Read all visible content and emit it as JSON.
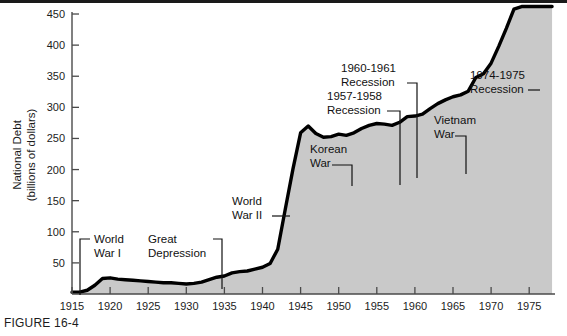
{
  "figure": {
    "caption": "FIGURE 16-4"
  },
  "chart_data": {
    "type": "area",
    "title": "",
    "xlabel": "",
    "ylabel": "National Debt (billions of dollars)",
    "ylabel_line1": "National Debt",
    "ylabel_line2": "(billions of dollars)",
    "xlim": [
      1915,
      1978
    ],
    "ylim": [
      0,
      470
    ],
    "grid": false,
    "legend": "none",
    "area_fill_color": "#c9c9c9",
    "line_color": "#000000",
    "background_color": "#ffffff",
    "y_ticks": [
      50,
      100,
      150,
      200,
      250,
      300,
      350,
      400,
      450
    ],
    "y_tick_labels": [
      "50",
      "100",
      "150",
      "200",
      "250",
      "300",
      "350",
      "400",
      "450"
    ],
    "x_ticks": [
      1915,
      1920,
      1925,
      1930,
      1935,
      1940,
      1945,
      1950,
      1955,
      1960,
      1965,
      1970,
      1975
    ],
    "x_tick_labels": [
      "1915",
      "1920",
      "1925",
      "1930",
      "1935",
      "1940",
      "1945",
      "1950",
      "1955",
      "1960",
      "1965",
      "1970",
      "1975"
    ],
    "x": [
      1915,
      1916,
      1917,
      1918,
      1919,
      1920,
      1921,
      1922,
      1923,
      1924,
      1925,
      1926,
      1927,
      1928,
      1929,
      1930,
      1931,
      1932,
      1933,
      1934,
      1935,
      1936,
      1937,
      1938,
      1939,
      1940,
      1941,
      1942,
      1943,
      1944,
      1945,
      1946,
      1947,
      1948,
      1949,
      1950,
      1951,
      1952,
      1953,
      1954,
      1955,
      1956,
      1957,
      1958,
      1959,
      1960,
      1961,
      1962,
      1963,
      1964,
      1965,
      1966,
      1967,
      1968,
      1969,
      1970,
      1971,
      1972,
      1973,
      1974,
      1975,
      1976,
      1977,
      1978
    ],
    "values": [
      3,
      3,
      6,
      14,
      25,
      26,
      24,
      23,
      22,
      21,
      20,
      19,
      18,
      18,
      17,
      16,
      17,
      19,
      23,
      27,
      29,
      34,
      36,
      37,
      40,
      43,
      49,
      72,
      137,
      201,
      259,
      270,
      258,
      252,
      253,
      257,
      255,
      259,
      266,
      271,
      274,
      273,
      271,
      276,
      285,
      286,
      289,
      298,
      306,
      312,
      317,
      320,
      326,
      348,
      354,
      371,
      398,
      427,
      458,
      475,
      533,
      620,
      699,
      772
    ],
    "display_values_scaled_note": "curve plotted against left axis 0-450+ billions",
    "annotations": [
      {
        "label_line1": "World",
        "label_line2": "War I",
        "year": 1917,
        "name": "world-war-i"
      },
      {
        "label_line1": "Great",
        "label_line2": "Depression",
        "year": 1934,
        "name": "great-depression"
      },
      {
        "label_line1": "World",
        "label_line2": "War II",
        "year": 1943,
        "name": "world-war-ii"
      },
      {
        "label_line1": "Korean",
        "label_line2": "War",
        "year": 1951,
        "name": "korean-war"
      },
      {
        "label_line1": "1957-1958",
        "label_line2": "Recession",
        "year": 1958,
        "name": "recession-1957-1958"
      },
      {
        "label_line1": "1960-1961",
        "label_line2": "Recession",
        "year": 1961,
        "name": "recession-1960-1961"
      },
      {
        "label_line1": "Vietnam",
        "label_line2": "War",
        "year": 1967,
        "name": "vietnam-war"
      },
      {
        "label_line1": "1974-1975",
        "label_line2": "Recession",
        "year": 1975,
        "name": "recession-1974-1975"
      }
    ]
  }
}
